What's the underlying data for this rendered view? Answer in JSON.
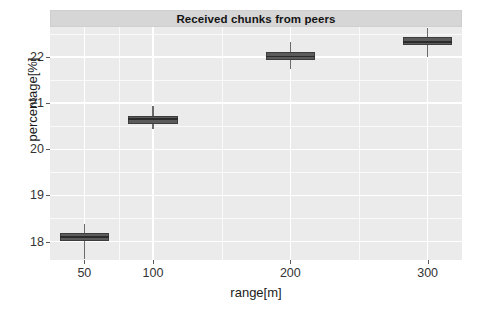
{
  "chart_data": {
    "type": "boxplot",
    "title": "Received chunks from peers",
    "xlabel": "range[m]",
    "ylabel": "percentage[%]",
    "grid": true,
    "legend": "none",
    "xlim": [
      25,
      325
    ],
    "ylim": [
      17.6,
      22.65
    ],
    "x_ticks": [
      50,
      100,
      200,
      300
    ],
    "x_tick_labels": [
      "50",
      "100",
      "200",
      "300"
    ],
    "y_ticks": [
      18,
      19,
      20,
      21,
      22
    ],
    "y_tick_labels": [
      "18",
      "19",
      "20",
      "21",
      "22"
    ],
    "y_minor_ticks": [
      17.5,
      18.5,
      19.5,
      20.5,
      21.5,
      22.5
    ],
    "categories": [
      "50",
      "100",
      "200",
      "300"
    ],
    "box_color": "#5b5b5b",
    "panel_color": "#ebebeb",
    "grid_color": "#ffffff",
    "strip_color": "#d6d6d6",
    "boxes": [
      {
        "category": "50",
        "x": 50,
        "half_width": 18,
        "lower_whisker": 17.62,
        "q1": 18.02,
        "median": 18.1,
        "q3": 18.19,
        "upper_whisker": 18.38
      },
      {
        "category": "100",
        "x": 100,
        "half_width": 18,
        "lower_whisker": 20.44,
        "q1": 20.55,
        "median": 20.65,
        "q3": 20.72,
        "upper_whisker": 20.93
      },
      {
        "category": "200",
        "x": 200,
        "half_width": 18,
        "lower_whisker": 21.74,
        "q1": 21.94,
        "median": 22.01,
        "q3": 22.11,
        "upper_whisker": 22.32
      },
      {
        "category": "300",
        "x": 300,
        "half_width": 18,
        "lower_whisker": 22.0,
        "q1": 22.26,
        "median": 22.32,
        "q3": 22.43,
        "upper_whisker": 22.62
      }
    ]
  }
}
